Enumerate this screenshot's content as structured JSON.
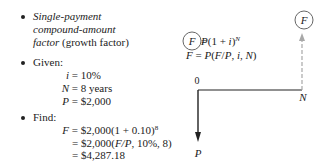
{
  "bullets": [
    {
      "lines": [
        {
          "italic": "Single-payment",
          "normal": ""
        },
        {
          "italic": "compound-amount",
          "normal": ""
        },
        {
          "italic": "factor",
          "normal": " (growth factor)"
        }
      ]
    },
    {
      "label": "Given:",
      "items": [
        {
          "var": "i",
          "rhs": " = 10%"
        },
        {
          "var": "N",
          "rhs": " = 8 years"
        },
        {
          "var": "P",
          "rhs": " = $2,000"
        }
      ]
    },
    {
      "label": "Find:",
      "lines": [
        {
          "var": "F",
          "rhs": " = $2,000(1 + 0.10)",
          "sup": "8"
        },
        {
          "var": "",
          "rhs": "= $2,000(",
          "italic": "F/P",
          "tail": ", 10%, 8)"
        },
        {
          "var": "",
          "rhs": "= $4,287.18"
        }
      ]
    }
  ],
  "formula": {
    "line1": {
      "circled": "F",
      "rhs": " = P(1 + i)",
      "sup": "N"
    },
    "line2": {
      "lhs": "F",
      "rhs": " = P(F/P, i, N)"
    }
  },
  "cash_flow_diagram": {
    "time_start_label": "0",
    "time_end_label": "N",
    "present_label": "P",
    "future_label": "F",
    "colors": {
      "line": "#222222",
      "dashed_arrow": "#a8a8a8",
      "circle": "#555555"
    }
  }
}
